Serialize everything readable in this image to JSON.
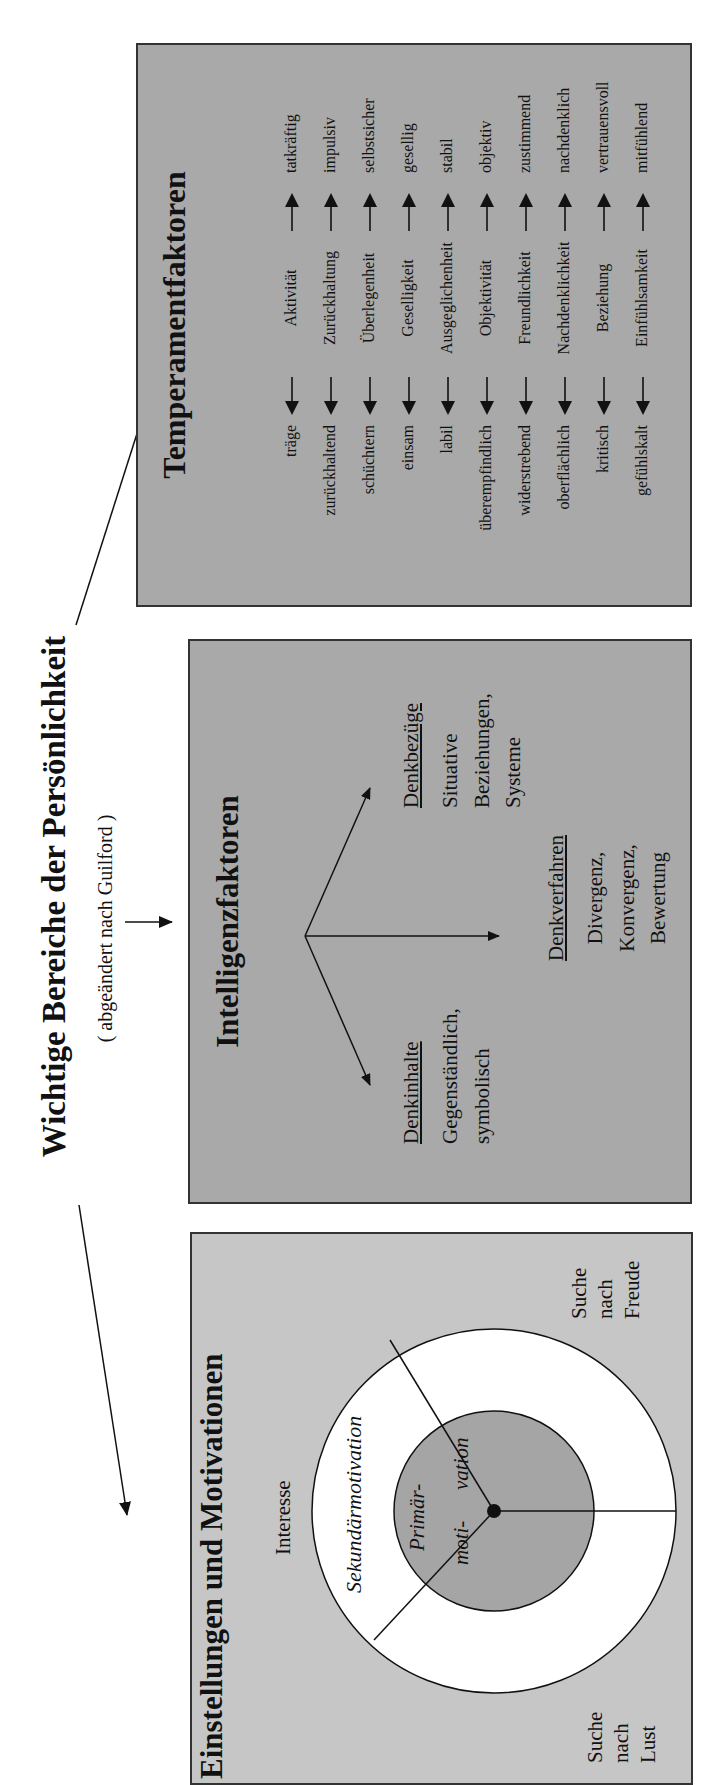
{
  "title": "Wichtige Bereiche der Persönlichkeit",
  "subtitle": "( abgeändert nach Guilford )",
  "colors": {
    "panel_dark": "#a9a9a9",
    "panel_light": "#c6c6c6",
    "inner_circle": "#a5a5a5",
    "outer_ring": "#ffffff",
    "line": "#111111"
  },
  "motivation": {
    "title": "Einstellungen und Motivationen",
    "interesse": "Interesse",
    "sekundaer": "Sekundärmotivation",
    "primaer_1": "Primär-",
    "primaer_2": "moti-",
    "primaer_3": "vation",
    "lust": [
      "Suche",
      "nach",
      "Lust"
    ],
    "freude": [
      "Suche",
      "nach",
      "Freude"
    ]
  },
  "intelligence": {
    "title": "Intelligenzfaktoren",
    "denkinhalte": {
      "heading": "Denkinhalte",
      "lines": [
        "Gegenständlich,",
        "symbolisch"
      ]
    },
    "denkverfahren": {
      "heading": "Denkverfahren",
      "lines": [
        "Divergenz,",
        "Konvergenz,",
        "Bewertung"
      ]
    },
    "denkbezuege": {
      "heading": "Denkbezüge",
      "lines": [
        "Situative",
        "Beziehungen,",
        "Systeme"
      ]
    }
  },
  "temperament": {
    "title": "Temperamentfaktoren",
    "rows": [
      {
        "left": "träge",
        "factor": "Aktivität",
        "right": "tatkräftig"
      },
      {
        "left": "zurückhaltend",
        "factor": "Zurückhaltung",
        "right": "impulsiv"
      },
      {
        "left": "schüchtern",
        "factor": "Überlegenheit",
        "right": "selbstsicher"
      },
      {
        "left": "einsam",
        "factor": "Geselligkeit",
        "right": "gesellig"
      },
      {
        "left": "labil",
        "factor": "Ausgeglichenheit",
        "right": "stabil"
      },
      {
        "left": "überempfindlich",
        "factor": "Objektivität",
        "right": "objektiv"
      },
      {
        "left": "widerstrebend",
        "factor": "Freundlichkeit",
        "right": "zustimmend"
      },
      {
        "left": "oberflächlich",
        "factor": "Nachdenklichkeit",
        "right": "nachdenklich"
      },
      {
        "left": "kritisch",
        "factor": "Beziehung",
        "right": "vertrauensvoll"
      },
      {
        "left": "gefühlskalt",
        "factor": "Einfühlsamkeit",
        "right": "mitfühlend"
      }
    ]
  }
}
